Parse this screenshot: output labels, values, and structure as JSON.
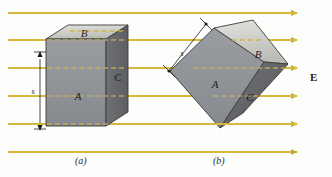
{
  "figure": {
    "background_color": "#fdfdfc",
    "width": 332,
    "height": 177
  },
  "field": {
    "label": "E",
    "label_bold": true,
    "color": "#d9bf4a",
    "line_color": "#d4b93c",
    "arrow_color": "#c9a92e",
    "direction": "left-to-right",
    "line_count": 6,
    "line_y": [
      13,
      40,
      68,
      96,
      124,
      152
    ],
    "line_x_start": 8,
    "line_x_end": 303
  },
  "panels": [
    {
      "caption": "(a)",
      "caption_x": 75,
      "caption_y": 155,
      "orientation": "axis-aligned",
      "dimension": {
        "label": "s",
        "label_x": 33,
        "label_y": 90,
        "line_x": 40,
        "line_y_top": 56,
        "line_y_bottom": 126
      },
      "faces": [
        {
          "id": "A",
          "label": "A",
          "role": "front-face",
          "color": "#8f9296",
          "label_x": 78,
          "label_y": 96
        },
        {
          "id": "B",
          "label": "B",
          "role": "top-face",
          "color": "#cdcdc9",
          "label_x": 82,
          "label_y": 44
        },
        {
          "id": "C",
          "label": "C",
          "role": "right-face",
          "color": "#6a6c70",
          "label_x": 131,
          "label_y": 79
        }
      ]
    },
    {
      "caption": "(b)",
      "caption_x": 213,
      "caption_y": 155,
      "orientation": "tilted",
      "dimension": {
        "label": "s",
        "label_x": 182,
        "label_y": 57,
        "x1": 205,
        "y1": 25,
        "x2": 170,
        "y2": 70
      },
      "faces": [
        {
          "id": "A",
          "label": "A",
          "role": "front-face",
          "color": "#8f9296",
          "label_x": 218,
          "label_y": 84
        },
        {
          "id": "B",
          "label": "B",
          "role": "top-face",
          "color": "#cdcdc9",
          "label_x": 257,
          "label_y": 56
        },
        {
          "id": "C",
          "label": "C",
          "role": "right-face",
          "color": "#6a6c70",
          "label_x": 252,
          "label_y": 100
        }
      ]
    }
  ],
  "colors": {
    "face_front": "#8f9296",
    "face_top": "#cdcdc9",
    "face_right": "#6a6c70",
    "edge": "#3b3b3b",
    "field": "#d4b93c",
    "text": "#1c1c1c"
  }
}
